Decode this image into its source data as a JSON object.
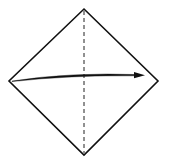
{
  "diagram": {
    "type": "origami-fold-step",
    "shape": "square-diamond",
    "vertices": {
      "top": [
        84,
        9
      ],
      "right": [
        158,
        81
      ],
      "bottom": [
        84,
        155
      ],
      "left": [
        9,
        81
      ]
    },
    "fold_line": {
      "style": "valley-fold-dashed",
      "from": [
        84,
        9
      ],
      "to": [
        84,
        155
      ]
    },
    "arrow": {
      "direction": "left-to-right",
      "from": [
        13,
        80
      ],
      "to": [
        144,
        75
      ],
      "meaning": "fold left corner over to right corner"
    },
    "colors": {
      "line": "#111111",
      "background": "#ffffff"
    }
  }
}
